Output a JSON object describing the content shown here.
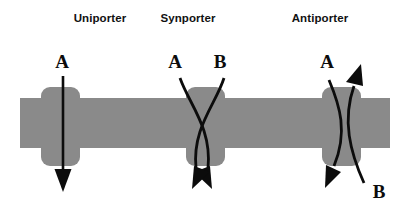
{
  "figure": {
    "width": 408,
    "height": 213,
    "background_color": "#ffffff"
  },
  "colors": {
    "membrane_gray": "#8a8a8a",
    "arrow_black": "#0c0c0c",
    "title_text": "#111111",
    "background": "#ffffff"
  },
  "membrane": {
    "label": "lipid bilayer membrane",
    "x": 20,
    "y": 98,
    "width": 370,
    "height": 50,
    "color": "#8a8a8a"
  },
  "panels": [
    {
      "id": "uniporter",
      "title": "Uniporter",
      "title_x": 100,
      "title_y": 22,
      "transport_type": "uniport",
      "protein": {
        "x": 41,
        "y": 87,
        "width": 39,
        "height": 79,
        "radius": 9
      },
      "solutes": [
        {
          "label": "A",
          "label_x": 62,
          "label_y": 68,
          "direction": "down",
          "path_shape": "straight",
          "crosses": false
        }
      ]
    },
    {
      "id": "synporter",
      "title": "Synporter",
      "title_x": 188,
      "title_y": 22,
      "transport_type": "symport",
      "protein": {
        "x": 186,
        "y": 87,
        "width": 39,
        "height": 79,
        "radius": 9
      },
      "solutes": [
        {
          "label": "A",
          "label_x": 175,
          "label_y": 68,
          "direction": "down",
          "path_shape": "curved",
          "crosses": true
        },
        {
          "label": "B",
          "label_x": 220,
          "label_y": 68,
          "direction": "down",
          "path_shape": "curved",
          "crosses": true
        }
      ]
    },
    {
      "id": "antiporter",
      "title": "Antiporter",
      "title_x": 320,
      "title_y": 22,
      "transport_type": "antiport",
      "protein": {
        "x": 322,
        "y": 87,
        "width": 39,
        "height": 79,
        "radius": 9
      },
      "solutes": [
        {
          "label": "A",
          "label_x": 327,
          "label_y": 68,
          "direction": "down",
          "path_shape": "curved",
          "crosses": true
        },
        {
          "label": "B",
          "label_x": 379,
          "label_y": 198,
          "direction": "up",
          "path_shape": "curved",
          "crosses": true
        }
      ]
    }
  ]
}
